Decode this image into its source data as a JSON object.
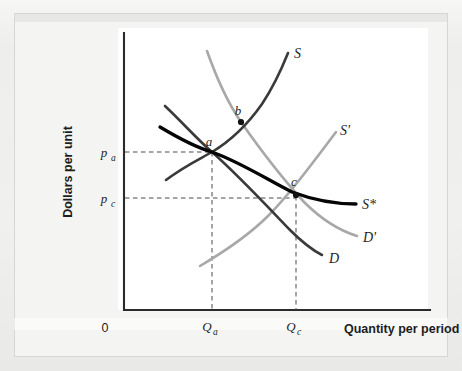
{
  "figure": {
    "background_color": "#efefed",
    "plot_background_color": "#ffffff"
  },
  "axes": {
    "y_title": "Dollars per unit",
    "x_title": "Quantity per period",
    "origin_label": "0",
    "axis_color": "#2b2b2b"
  },
  "chart_data": {
    "type": "line",
    "title": "",
    "xlabel": "Quantity per period",
    "ylabel": "Dollars per unit",
    "grid": false,
    "legend": "inline-curve-labels",
    "xlim": [
      0,
      100
    ],
    "ylim": [
      0,
      100
    ],
    "axis_tick_labels": {
      "y": [
        "p_a",
        "p_c"
      ],
      "x": [
        "0",
        "Q_a",
        "Q_c"
      ]
    },
    "price_levels": [
      {
        "name": "p_a",
        "label": "p",
        "subscript": "a",
        "value_y_px": 152
      },
      {
        "name": "p_c",
        "label": "p",
        "subscript": "c",
        "value_y_px": 198
      }
    ],
    "quantity_levels": [
      {
        "name": "Q_a",
        "label": "Q",
        "subscript": "a",
        "value_x_px": 212
      },
      {
        "name": "Q_c",
        "label": "Q",
        "subscript": "c",
        "value_x_px": 296
      }
    ],
    "series": [
      {
        "name": "S",
        "label": "S",
        "kind": "supply",
        "color": "#3a3a3a",
        "style": "dark-medium",
        "slope": "upward",
        "path": "M 166,180 C 186,165 200,159 212,152 C 232,140 248,124 262,104 C 274,86 282,68 288,53",
        "label_x": 294,
        "label_y": 54
      },
      {
        "name": "S'",
        "label": "S'",
        "kind": "supply-shifted",
        "color": "#a8a8a8",
        "style": "light-medium",
        "slope": "upward",
        "path": "M 200,266 C 222,253 248,236 268,216 C 288,196 312,164 336,132",
        "label_x": 340,
        "label_y": 131
      },
      {
        "name": "S*",
        "label": "S*",
        "kind": "long-run-supply",
        "color": "#050505",
        "style": "thick-black",
        "slope": "downward-flattening",
        "path": "M 160,127 C 180,139 198,148 212,152 C 240,162 268,180 292,192 C 316,201 340,204 356,204",
        "label_x": 362,
        "label_y": 205
      },
      {
        "name": "D",
        "label": "D",
        "kind": "demand",
        "color": "#3a3a3a",
        "style": "dark-medium",
        "slope": "downward",
        "path": "M 165,106 C 182,122 198,140 212,152 C 238,175 266,205 290,230 C 304,244 314,251 322,255",
        "label_x": 329,
        "label_y": 259
      },
      {
        "name": "D'",
        "label": "D'",
        "kind": "demand-shifted",
        "color": "#a8a8a8",
        "style": "light-medium",
        "slope": "downward",
        "path": "M 207,51 C 218,82 230,106 241,122 C 262,152 282,178 304,202 C 324,222 344,232 357,236",
        "label_x": 363,
        "label_y": 238
      }
    ],
    "points": [
      {
        "name": "a",
        "label": "a",
        "x_px": 212,
        "y_px": 152,
        "label_x": 209,
        "label_y": 144,
        "marker": false,
        "description": "initial equilibrium: S and D intersect at p_a, Q_a"
      },
      {
        "name": "b",
        "label": "b",
        "x_px": 241,
        "y_px": 122,
        "label_x": 238,
        "label_y": 114,
        "marker": true,
        "description": "intersection of S and D' above p_a"
      },
      {
        "name": "c",
        "label": "c",
        "x_px": 296,
        "y_px": 195,
        "label_x": 293,
        "label_y": 184,
        "marker": true,
        "description": "new equilibrium: S' and D' intersect at p_c, Q_c"
      }
    ],
    "dashed_guides": [
      {
        "name": "pa-horizontal",
        "from": [
          125,
          152
        ],
        "to": [
          212,
          152
        ]
      },
      {
        "name": "pc-horizontal",
        "from": [
          125,
          198
        ],
        "to": [
          296,
          198
        ]
      },
      {
        "name": "Qa-vertical",
        "from": [
          212,
          152
        ],
        "to": [
          212,
          310
        ]
      },
      {
        "name": "Qc-vertical",
        "from": [
          296,
          196
        ],
        "to": [
          296,
          310
        ]
      }
    ]
  }
}
